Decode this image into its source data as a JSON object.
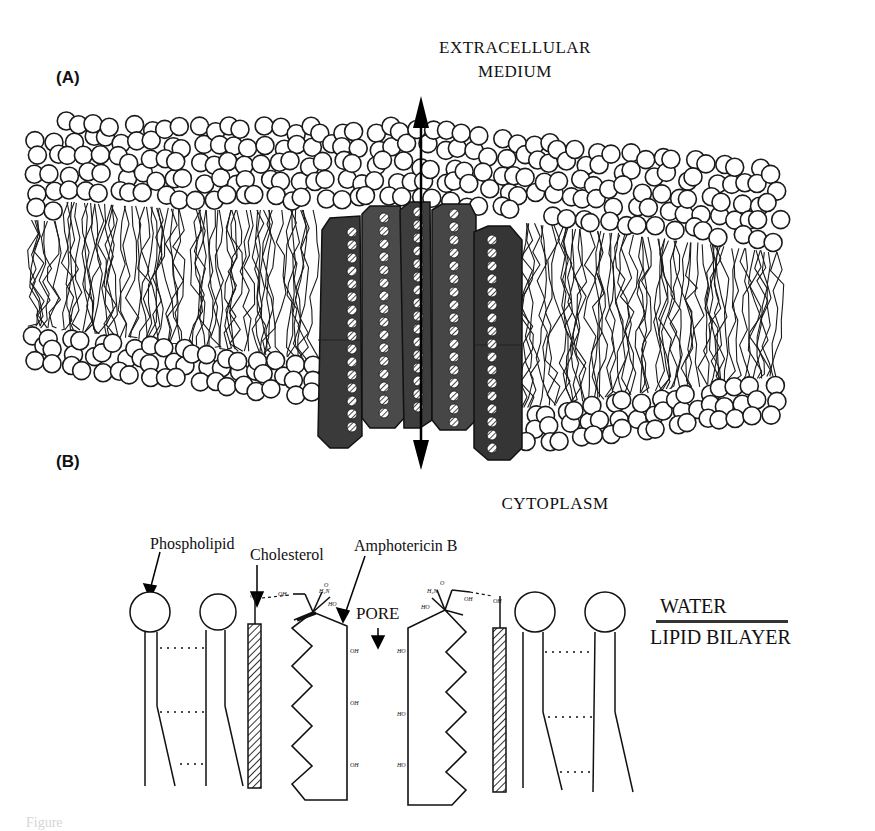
{
  "figure": {
    "panel_a": {
      "label": "(A)",
      "top_label_line1": "EXTRACELLULAR",
      "top_label_line2": "MEDIUM",
      "bottom_label": "CYTOPLASM",
      "arrow": "bidirectional-vertical"
    },
    "panel_b": {
      "label": "(B)",
      "annotations": {
        "phospholipid": "Phospholipid",
        "cholesterol": "Cholesterol",
        "amphotericin": "Amphotericin B",
        "pore": "PORE"
      },
      "chem_labels": {
        "ch_left": "CH",
        "oh_left": "OH",
        "h2n_left": "H₂N",
        "ho_left": "HO",
        "o_left": "O",
        "oh_chain_1": "OH",
        "oh_chain_2": "OH",
        "oh_chain_3": "OH",
        "ho_chain_1": "HO",
        "ho_chain_2": "HO",
        "ho_chain_3": "HO",
        "h2n_right": "H₂N",
        "ho_right": "HO",
        "o_right": "O",
        "oh_right": "OH",
        "ch_right": "OH"
      },
      "legend": {
        "water": "WATER",
        "lipid_bilayer": "LIPID BILAYER"
      }
    },
    "caption_partial": "Figure"
  }
}
